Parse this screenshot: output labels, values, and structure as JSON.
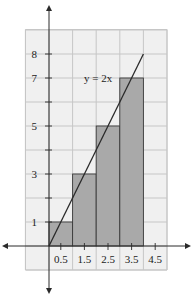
{
  "chart_data": {
    "type": "bar",
    "title": "",
    "xlabel": "",
    "ylabel": "",
    "xlim": [
      -2,
      6
    ],
    "ylim": [
      -1,
      10
    ],
    "grid": true,
    "bars": [
      {
        "x_start": 0,
        "x_end": 1,
        "height": 1
      },
      {
        "x_start": 1,
        "x_end": 2,
        "height": 3
      },
      {
        "x_start": 2,
        "x_end": 3,
        "height": 5
      },
      {
        "x_start": 3,
        "x_end": 4,
        "height": 7
      }
    ],
    "line": {
      "label": "y = 2x",
      "points": [
        [
          0,
          0
        ],
        [
          4,
          8
        ]
      ]
    },
    "x_ticks": [
      {
        "value": 0.5,
        "label": "0.5"
      },
      {
        "value": 1.5,
        "label": "1.5"
      },
      {
        "value": 2.5,
        "label": "2.5"
      },
      {
        "value": 3.5,
        "label": "3.5"
      },
      {
        "value": 4.5,
        "label": "4.5"
      }
    ],
    "y_ticks": [
      {
        "value": 1,
        "label": "1"
      },
      {
        "value": 2,
        "label": ""
      },
      {
        "value": 3,
        "label": "3"
      },
      {
        "value": 4,
        "label": ""
      },
      {
        "value": 5,
        "label": "5"
      },
      {
        "value": 6,
        "label": ""
      },
      {
        "value": 7,
        "label": "7"
      },
      {
        "value": 8,
        "label": "8"
      }
    ]
  },
  "annotations": {
    "equation": "y = 2x"
  },
  "colors": {
    "grid_bg": "#f0f0f0",
    "grid_line": "#c6c6c6",
    "bar_fill": "#a9a9a9",
    "line": "#2a2a2a",
    "axis": "#2a2a2a"
  }
}
